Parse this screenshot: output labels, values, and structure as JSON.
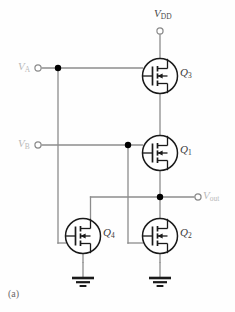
{
  "figure": {
    "caption": "(a)",
    "type": "cmos-logic-gate-schematic"
  },
  "colors": {
    "wire": "#8c8c8c",
    "device_outline": "#1a1a1a",
    "junction_dot": "#000000",
    "terminal_ring": "#8c8c8c",
    "faint_label": "#b9b9b9",
    "device_label": "#3a3a3a",
    "background": "#fefefe"
  },
  "labels": {
    "supply": {
      "base": "V",
      "sub": "DD",
      "name": "V_DD"
    },
    "input_a": {
      "base": "V",
      "sub": "A",
      "name": "V_A"
    },
    "input_b": {
      "base": "V",
      "sub": "B",
      "name": "V_B"
    },
    "output": {
      "base": "V",
      "sub": "out",
      "name": "V_out"
    }
  },
  "devices": [
    {
      "id": "Q3",
      "base": "Q",
      "sub": "3",
      "kind": "mosfet",
      "position": "top-right",
      "cx": 160,
      "cy": 76
    },
    {
      "id": "Q1",
      "base": "Q",
      "sub": "1",
      "kind": "mosfet",
      "position": "middle-right",
      "cx": 160,
      "cy": 153
    },
    {
      "id": "Q4",
      "base": "Q",
      "sub": "4",
      "kind": "mosfet",
      "position": "bottom-left",
      "cx": 83,
      "cy": 236
    },
    {
      "id": "Q2",
      "base": "Q",
      "sub": "2",
      "kind": "mosfet",
      "position": "bottom-right",
      "cx": 160,
      "cy": 236
    }
  ],
  "terminals": [
    {
      "name": "vdd-terminal",
      "x": 160,
      "y": 31,
      "style": "open-circle"
    },
    {
      "name": "va-terminal",
      "x": 38,
      "y": 68,
      "style": "open-circle"
    },
    {
      "name": "vb-terminal",
      "x": 38,
      "y": 145,
      "style": "open-circle"
    },
    {
      "name": "vout-terminal",
      "x": 198,
      "y": 197,
      "style": "open-circle"
    }
  ],
  "junctions": [
    {
      "name": "va-branch-node",
      "x": 58,
      "y": 68
    },
    {
      "name": "vb-branch-node",
      "x": 128,
      "y": 145
    },
    {
      "name": "output-node",
      "x": 160,
      "y": 197
    }
  ],
  "grounds": [
    {
      "name": "ground-q4",
      "x": 83,
      "y": 277
    },
    {
      "name": "ground-q2",
      "x": 160,
      "y": 277
    }
  ],
  "nets": [
    {
      "name": "vdd-to-q3-source",
      "from": "V_DD terminal",
      "to": "Q3 source"
    },
    {
      "name": "q3-drain-to-q1",
      "from": "Q3 drain",
      "to": "Q1 source"
    },
    {
      "name": "va-to-q3-gate",
      "from": "V_A terminal",
      "to": "Q3 gate"
    },
    {
      "name": "va-to-q4-gate",
      "from": "V_A branch",
      "to": "Q4 gate"
    },
    {
      "name": "vb-to-q1-gate",
      "from": "V_B terminal",
      "to": "Q1 gate"
    },
    {
      "name": "vb-to-q2-gate",
      "from": "V_B branch",
      "to": "Q2 gate"
    },
    {
      "name": "q1-drain-to-out",
      "from": "Q1 drain",
      "to": "output node"
    },
    {
      "name": "out-to-q4-drain",
      "from": "output node",
      "to": "Q4 drain"
    },
    {
      "name": "out-to-q2-drain",
      "from": "output node",
      "to": "Q2 drain"
    },
    {
      "name": "q4-source-to-gnd",
      "from": "Q4 source",
      "to": "ground"
    },
    {
      "name": "q2-source-to-gnd",
      "from": "Q2 source",
      "to": "ground"
    }
  ]
}
